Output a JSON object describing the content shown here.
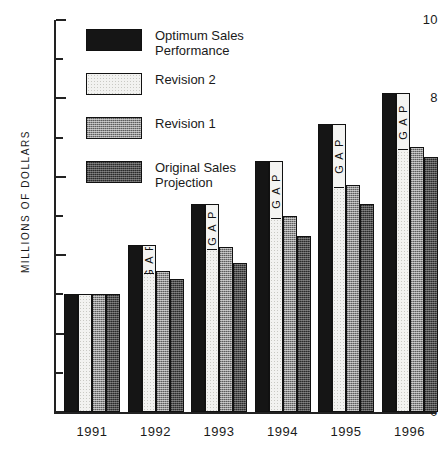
{
  "chart_data": {
    "type": "bar",
    "title": "",
    "xlabel": "",
    "ylabel": "MILLIONS OF DOLLARS",
    "categories": [
      "1991",
      "1992",
      "1993",
      "1994",
      "1995",
      "1996"
    ],
    "ylim": [
      0,
      10
    ],
    "ytick_major": [
      "0",
      "2",
      "4",
      "6",
      "8",
      "10"
    ],
    "ytick_minor": [
      1,
      3,
      5,
      7,
      9
    ],
    "grid": false,
    "legend_position": "upper-left-inside",
    "series": [
      {
        "name": "Optimum Sales\nPerformance",
        "key": "optimum",
        "values": [
          3.0,
          4.25,
          5.3,
          6.4,
          7.35,
          8.15
        ]
      },
      {
        "name": "Revision 2",
        "key": "rev2",
        "values": [
          3.0,
          4.25,
          5.3,
          6.4,
          7.35,
          8.15
        ]
      },
      {
        "name": "Revision 1",
        "key": "rev1",
        "values": [
          3.0,
          3.6,
          4.2,
          5.0,
          5.8,
          6.75
        ]
      },
      {
        "name": "Original Sales\nProjection",
        "key": "original",
        "values": [
          3.0,
          3.4,
          3.8,
          4.5,
          5.3,
          6.5
        ]
      }
    ],
    "annotations": [
      {
        "label": "G A P",
        "category": "1992",
        "series": "rev2",
        "from": 3.6,
        "to": 4.25
      },
      {
        "label": "G A P",
        "category": "1993",
        "series": "rev2",
        "from": 4.2,
        "to": 5.3
      },
      {
        "label": "G A P",
        "category": "1994",
        "series": "rev2",
        "from": 5.0,
        "to": 6.4
      },
      {
        "label": "G A P",
        "category": "1995",
        "series": "rev2",
        "from": 5.8,
        "to": 7.35
      },
      {
        "label": "G A P",
        "category": "1996",
        "series": "rev2",
        "from": 6.75,
        "to": 8.15
      }
    ],
    "colors": {
      "optimum": "#151515",
      "rev2": "#f2f2f0",
      "rev1": "#8f8f8f",
      "original": "#4e4e4e",
      "axis": "#222222",
      "background": "#ffffff"
    }
  }
}
